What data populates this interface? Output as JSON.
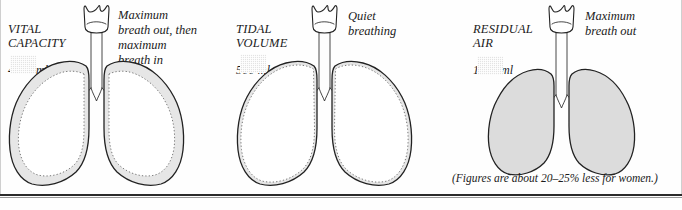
{
  "figure": {
    "footnote": "(Figures are about 20–25% less for women.)",
    "colors": {
      "ink": "#1b1b1b",
      "shade_fill": "#e3e3e3",
      "paper": "#fefefe",
      "rule": "#2b2b2b"
    }
  },
  "panels": [
    {
      "id": "vital-capacity",
      "label_title": "VITAL\nCAPACITY",
      "label_amount": "4000 ml",
      "caption": "Maximum\nbreath out, then\nmaximum\nbreath in",
      "swatch_name": "shaded-volume-key",
      "diagram": "lungs-outer-band-shaded"
    },
    {
      "id": "tidal-volume",
      "label_title": "TIDAL\nVOLUME",
      "label_amount": "500 ml",
      "caption": "Quiet\nbreathing",
      "swatch_name": "shaded-volume-key",
      "diagram": "lungs-thin-rim-shaded"
    },
    {
      "id": "residual-air",
      "label_title": "RESIDUAL\nAIR",
      "label_amount": "1500 ml",
      "caption": "Maximum\nbreath out",
      "swatch_name": "shaded-volume-key",
      "diagram": "lungs-fully-shaded"
    }
  ]
}
